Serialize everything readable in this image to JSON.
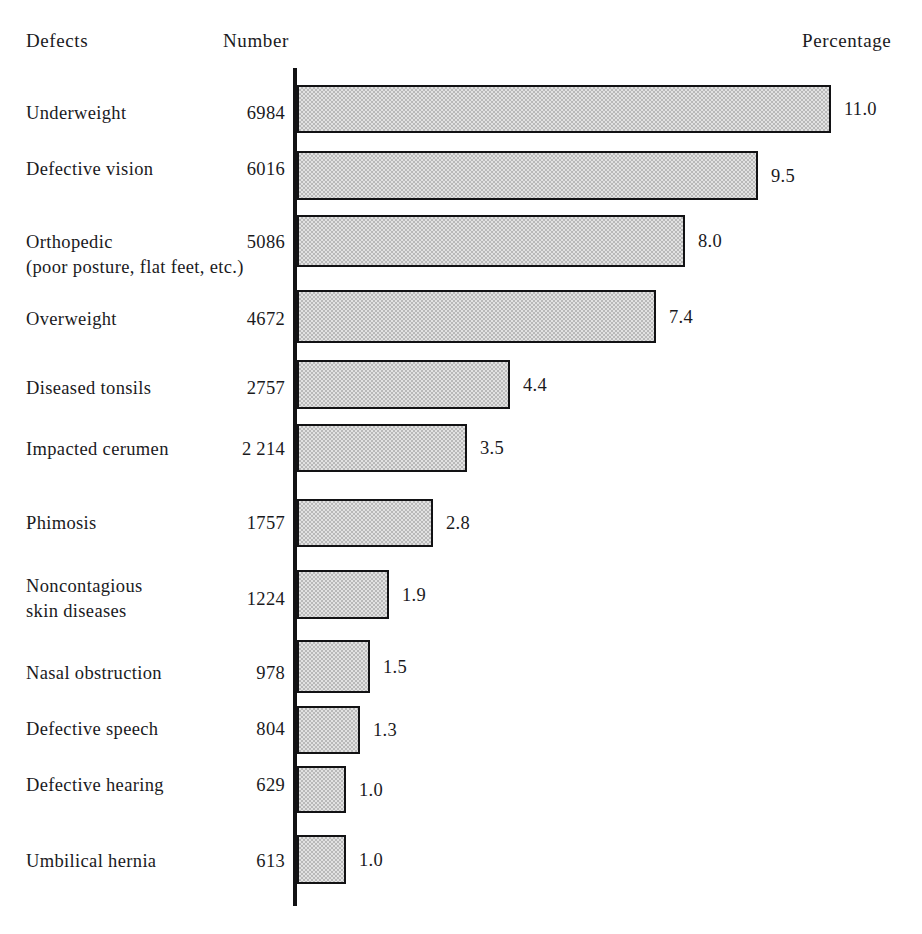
{
  "header": {
    "defects": "Defects",
    "number": "Number",
    "percentage": "Percentage"
  },
  "axis": {
    "origin_x_px": 295,
    "px_per_percent": 48.5
  },
  "chart_data": {
    "type": "bar",
    "orientation": "horizontal",
    "title": "",
    "xlabel": "Percentage",
    "ylabel": "Defects",
    "grid": false,
    "legend": false,
    "xlim": [
      0,
      11.0
    ],
    "categories": [
      "Underweight",
      "Defective vision",
      "Orthopedic\n(poor posture, flat feet, etc.)",
      "Overweight",
      "Diseased  tonsils",
      "Impacted cerumen",
      "Phimosis",
      "Noncontagious\nskin diseases",
      "Nasal obstruction",
      "Defective speech",
      "Defective hearing",
      "Umbilical hernia"
    ],
    "series": [
      {
        "name": "Number",
        "values": [
          6984,
          6016,
          5086,
          4672,
          2757,
          2214,
          1757,
          1224,
          978,
          804,
          629,
          613
        ]
      },
      {
        "name": "Percentage",
        "values": [
          11.0,
          9.5,
          8.0,
          7.4,
          4.4,
          3.5,
          2.8,
          1.9,
          1.5,
          1.3,
          1.0,
          1.0
        ]
      }
    ]
  },
  "rows": [
    {
      "label": "Underweight",
      "number": "6984",
      "percent": 11.0,
      "percent_label": "11.0",
      "label_top": 101,
      "number_top": 101,
      "bar_top": 85,
      "bar_height": 48
    },
    {
      "label": "Defective vision",
      "number": "6016",
      "percent": 9.5,
      "percent_label": "9.5",
      "label_top": 157,
      "number_top": 157,
      "bar_top": 151,
      "bar_height": 49
    },
    {
      "label": "Orthopedic\n(poor posture, flat feet, etc.)",
      "number": "5086",
      "percent": 8.0,
      "percent_label": "8.0",
      "label_top": 230,
      "number_top": 230,
      "bar_top": 215,
      "bar_height": 52
    },
    {
      "label": "Overweight",
      "number": "4672",
      "percent": 7.4,
      "percent_label": "7.4",
      "label_top": 307,
      "number_top": 307,
      "bar_top": 290,
      "bar_height": 53
    },
    {
      "label": "Diseased  tonsils",
      "number": "2757",
      "percent": 4.4,
      "percent_label": "4.4",
      "label_top": 376,
      "number_top": 376,
      "bar_top": 360,
      "bar_height": 49
    },
    {
      "label": "Impacted cerumen",
      "number": "2 214",
      "percent": 3.5,
      "percent_label": "3.5",
      "label_top": 437,
      "number_top": 437,
      "bar_top": 424,
      "bar_height": 48
    },
    {
      "label": "Phimosis",
      "number": "1757",
      "percent": 2.8,
      "percent_label": "2.8",
      "label_top": 511,
      "number_top": 511,
      "bar_top": 499,
      "bar_height": 48
    },
    {
      "label": "Noncontagious\nskin diseases",
      "number": "1224",
      "percent": 1.9,
      "percent_label": "1.9",
      "label_top": 574,
      "number_top": 587,
      "bar_top": 570,
      "bar_height": 49
    },
    {
      "label": "Nasal obstruction",
      "number": "978",
      "percent": 1.5,
      "percent_label": "1.5",
      "label_top": 661,
      "number_top": 661,
      "bar_top": 640,
      "bar_height": 53
    },
    {
      "label": "Defective speech",
      "number": "804",
      "percent": 1.3,
      "percent_label": "1.3",
      "label_top": 717,
      "number_top": 717,
      "bar_top": 706,
      "bar_height": 48
    },
    {
      "label": "Defective hearing",
      "number": "629",
      "percent": 1.0,
      "percent_label": "1.0",
      "label_top": 773,
      "number_top": 773,
      "bar_top": 766,
      "bar_height": 47
    },
    {
      "label": "Umbilical hernia",
      "number": "613",
      "percent": 1.0,
      "percent_label": "1.0",
      "label_top": 849,
      "number_top": 849,
      "bar_top": 835,
      "bar_height": 49
    }
  ]
}
